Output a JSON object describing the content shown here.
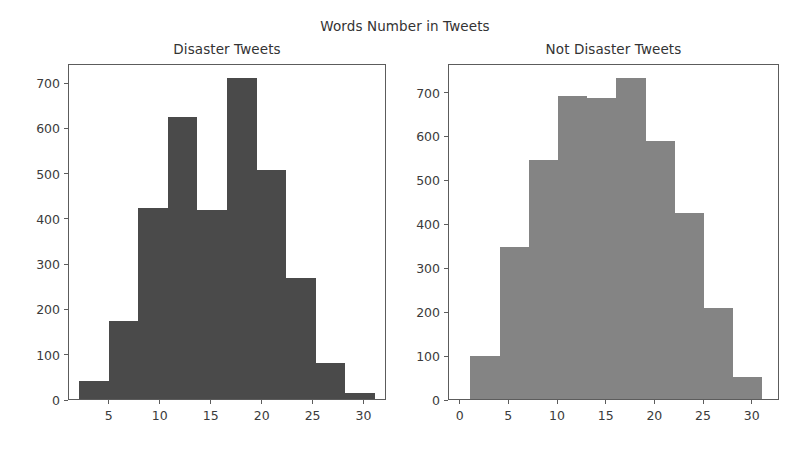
{
  "figure": {
    "suptitle": "Words Number in Tweets",
    "width": 810,
    "height": 468,
    "background": "#ffffff"
  },
  "chart_data": [
    {
      "type": "bar",
      "title": "Disaster Tweets",
      "subplot_index": 0,
      "xlabel": "",
      "ylabel": "",
      "xlim": [
        1.0,
        32.2
      ],
      "ylim": [
        0,
        742
      ],
      "grid": false,
      "legend": null,
      "bar_color": "#4a4a4a",
      "edge_color": "#4a4a4a",
      "xticks": [
        5,
        10,
        15,
        20,
        25,
        30
      ],
      "xticklabels": [
        "5",
        "10",
        "15",
        "20",
        "25",
        "30"
      ],
      "yticks": [
        0,
        100,
        200,
        300,
        400,
        500,
        600,
        700
      ],
      "yticklabels": [
        "0",
        "100",
        "200",
        "300",
        "400",
        "500",
        "600",
        "700"
      ],
      "bin_edges": [
        2.0,
        4.9,
        7.8,
        10.7,
        13.6,
        16.5,
        19.4,
        22.3,
        25.2,
        28.1,
        31.0
      ],
      "bin_centers": [
        3.45,
        6.35,
        9.25,
        12.15,
        15.05,
        17.95,
        20.85,
        23.75,
        26.65,
        29.55
      ],
      "values": [
        40,
        172,
        422,
        622,
        418,
        710,
        505,
        268,
        80,
        13
      ]
    },
    {
      "type": "bar",
      "title": "Not Disaster Tweets",
      "subplot_index": 1,
      "xlabel": "",
      "ylabel": "",
      "xlim": [
        -1.2,
        32.8
      ],
      "ylim": [
        0,
        765
      ],
      "grid": false,
      "legend": null,
      "bar_color": "#848484",
      "edge_color": "#848484",
      "xticks": [
        0,
        5,
        10,
        15,
        20,
        25,
        30
      ],
      "xticklabels": [
        "0",
        "5",
        "10",
        "15",
        "20",
        "25",
        "30"
      ],
      "yticks": [
        0,
        100,
        200,
        300,
        400,
        500,
        600,
        700
      ],
      "yticklabels": [
        "0",
        "100",
        "200",
        "300",
        "400",
        "500",
        "600",
        "700"
      ],
      "bin_edges": [
        1.0,
        4.0,
        7.0,
        10.0,
        13.0,
        16.0,
        19.0,
        22.0,
        25.0,
        28.0,
        31.0
      ],
      "bin_centers": [
        2.5,
        5.5,
        8.5,
        11.5,
        14.5,
        17.5,
        20.5,
        23.5,
        26.5,
        29.5
      ],
      "values": [
        98,
        345,
        545,
        690,
        685,
        730,
        588,
        423,
        208,
        50
      ]
    }
  ]
}
